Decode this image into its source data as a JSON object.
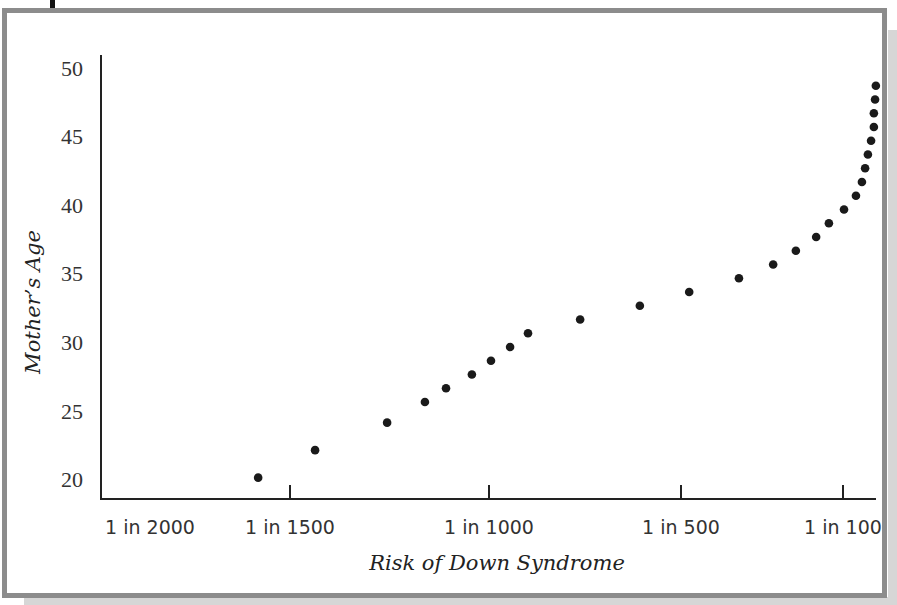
{
  "chart_data": {
    "type": "scatter",
    "title": "",
    "xlabel": "Risk of Down Syndrome",
    "ylabel": "Mother’s Age",
    "x_axis_reversed_denominator": true,
    "xlim": [
      2000,
      50
    ],
    "ylim": [
      20,
      50
    ],
    "x_ticks": [
      {
        "value": 2000,
        "label": "1 in 2000"
      },
      {
        "value": 1500,
        "label": "1 in 1500"
      },
      {
        "value": 1000,
        "label": "1 in 1000"
      },
      {
        "value": 500,
        "label": "1 in 500"
      },
      {
        "value": 100,
        "label": "1 in 100"
      }
    ],
    "y_ticks": [
      {
        "value": 50,
        "label": "50"
      },
      {
        "value": 45,
        "label": "45"
      },
      {
        "value": 40,
        "label": "40"
      },
      {
        "value": 35,
        "label": "35"
      },
      {
        "value": 30,
        "label": "30"
      },
      {
        "value": 25,
        "label": "25"
      },
      {
        "value": 20,
        "label": "20"
      }
    ],
    "grid": false,
    "legend": "none",
    "points": [
      {
        "risk_1_in": 1580,
        "age": 20.5
      },
      {
        "risk_1_in": 1437,
        "age": 22.5
      },
      {
        "risk_1_in": 1256,
        "age": 24.5
      },
      {
        "risk_1_in": 1161,
        "age": 26
      },
      {
        "risk_1_in": 1108,
        "age": 27
      },
      {
        "risk_1_in": 1043,
        "age": 28
      },
      {
        "risk_1_in": 995,
        "age": 29
      },
      {
        "risk_1_in": 947,
        "age": 30
      },
      {
        "risk_1_in": 902,
        "age": 31
      },
      {
        "risk_1_in": 771,
        "age": 32
      },
      {
        "risk_1_in": 621,
        "age": 33
      },
      {
        "risk_1_in": 497,
        "age": 34
      },
      {
        "risk_1_in": 372,
        "age": 35
      },
      {
        "risk_1_in": 286,
        "age": 36
      },
      {
        "risk_1_in": 229,
        "age": 37
      },
      {
        "risk_1_in": 178,
        "age": 38
      },
      {
        "risk_1_in": 146,
        "age": 39
      },
      {
        "risk_1_in": 108,
        "age": 40
      },
      {
        "risk_1_in": 78,
        "age": 41
      },
      {
        "risk_1_in": 63,
        "age": 42
      },
      {
        "risk_1_in": 55,
        "age": 43
      },
      {
        "risk_1_in": 48,
        "age": 44
      },
      {
        "risk_1_in": 40,
        "age": 45
      },
      {
        "risk_1_in": 33,
        "age": 46
      },
      {
        "risk_1_in": 33,
        "age": 47
      },
      {
        "risk_1_in": 30,
        "age": 48
      },
      {
        "risk_1_in": 28,
        "age": 49
      }
    ]
  }
}
